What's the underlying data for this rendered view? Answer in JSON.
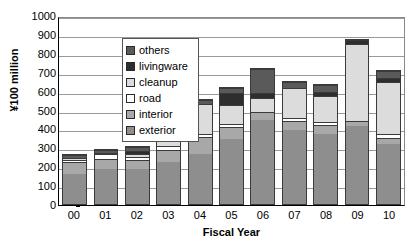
{
  "chart_data": {
    "type": "bar",
    "stacked": true,
    "title": "",
    "xlabel": "Fiscal Year",
    "ylabel": "¥100 million",
    "ylim": [
      0,
      1000
    ],
    "ytick_step": 100,
    "yticks": [
      "1000",
      "900",
      "800",
      "700",
      "600",
      "500",
      "400",
      "300",
      "200",
      "100",
      "0"
    ],
    "grid": true,
    "legend_position": "top-left inside plot",
    "categories": [
      "00",
      "01",
      "02",
      "03",
      "04",
      "05",
      "06",
      "07",
      "08",
      "09",
      "10"
    ],
    "series": [
      {
        "name": "exterior",
        "values": [
          160,
          183,
          185,
          224,
          262,
          345,
          442,
          390,
          372,
          415,
          317
        ]
      },
      {
        "name": "interior",
        "values": [
          60,
          54,
          48,
          64,
          90,
          60,
          46,
          50,
          48,
          25,
          33
        ]
      },
      {
        "name": "road",
        "values": [
          15,
          26,
          17,
          20,
          20,
          20,
          0,
          15,
          15,
          0,
          18
        ]
      },
      {
        "name": "cleanup",
        "values": [
          10,
          9,
          15,
          179,
          156,
          100,
          72,
          160,
          137,
          405,
          277
        ]
      },
      {
        "name": "livingware",
        "values": [
          0,
          0,
          15,
          0,
          0,
          60,
          25,
          0,
          20,
          23,
          23
        ]
      },
      {
        "name": "others",
        "values": [
          13,
          15,
          20,
          21,
          20,
          30,
          130,
          33,
          40,
          0,
          34
        ]
      }
    ],
    "totals": [
      258,
      287,
      300,
      508,
      548,
      615,
      715,
      648,
      632,
      868,
      702
    ],
    "colors": {
      "exterior": "#8e8e8e",
      "interior": "#a8a8a8",
      "road": "#ffffff",
      "cleanup": "#dcdcdc",
      "livingware": "#2e2e2e",
      "others": "#5a5a5a"
    },
    "legend": [
      {
        "label": "others",
        "key": "others"
      },
      {
        "label": "livingware",
        "key": "livingware"
      },
      {
        "label": "cleanup",
        "key": "cleanup"
      },
      {
        "label": "road",
        "key": "road"
      },
      {
        "label": "interior",
        "key": "interior"
      },
      {
        "label": "exterior",
        "key": "exterior"
      }
    ]
  }
}
